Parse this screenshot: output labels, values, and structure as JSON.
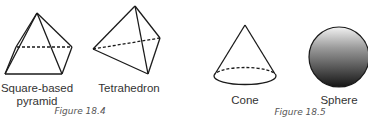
{
  "figures": [
    {
      "caption": "Figure 18.4",
      "shapes": [
        {
          "name": "Square-based pyramid",
          "label_line1": "Square-based",
          "label_line2": "pyramid"
        },
        {
          "name": "Tetrahedron",
          "label": "Tetrahedron"
        }
      ]
    },
    {
      "caption": "Figure 18.5",
      "shapes": [
        {
          "name": "Cone",
          "label": "Cone"
        },
        {
          "name": "Sphere",
          "label": "Sphere"
        }
      ]
    }
  ],
  "colors": {
    "line": "#1a1a1a",
    "sphere_light": "#e8e8e8",
    "sphere_dark": "#1a1a1a"
  }
}
